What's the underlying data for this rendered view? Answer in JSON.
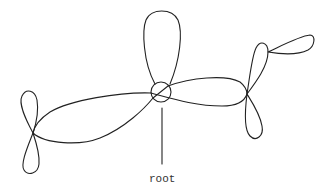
{
  "diagram": {
    "type": "knot-tree",
    "root_label": "root",
    "colors": {
      "stroke": "#222222",
      "background": "#ffffff",
      "text": "#333333"
    },
    "nodes": [
      {
        "id": "root",
        "x": 161,
        "y": 92,
        "marked": true
      },
      {
        "id": "left",
        "x": 33,
        "y": 133
      },
      {
        "id": "right",
        "x": 247,
        "y": 94
      }
    ]
  }
}
